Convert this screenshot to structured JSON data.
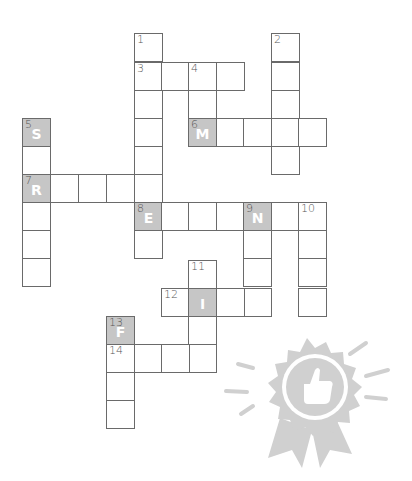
{
  "puzzle": {
    "cell_size": 28,
    "cells": [
      {
        "x": 134,
        "y": 33,
        "num": "1"
      },
      {
        "x": 134,
        "y": 62,
        "num": "3"
      },
      {
        "x": 161,
        "y": 62
      },
      {
        "x": 188,
        "y": 62,
        "num": "4"
      },
      {
        "x": 216,
        "y": 62
      },
      {
        "x": 134,
        "y": 90
      },
      {
        "x": 188,
        "y": 90
      },
      {
        "x": 134,
        "y": 118
      },
      {
        "x": 134,
        "y": 146
      },
      {
        "x": 134,
        "y": 174
      },
      {
        "x": 134,
        "y": 202,
        "num": "8",
        "letter": "E",
        "given": true
      },
      {
        "x": 134,
        "y": 230
      },
      {
        "x": 271,
        "y": 33,
        "num": "2"
      },
      {
        "x": 271,
        "y": 62
      },
      {
        "x": 271,
        "y": 90
      },
      {
        "x": 271,
        "y": 118
      },
      {
        "x": 271,
        "y": 146
      },
      {
        "x": 188,
        "y": 118,
        "num": "6",
        "letter": "M",
        "given": true
      },
      {
        "x": 216,
        "y": 118
      },
      {
        "x": 243,
        "y": 118
      },
      {
        "x": 298,
        "y": 118
      },
      {
        "x": 22,
        "y": 118,
        "num": "5",
        "letter": "S",
        "given": true
      },
      {
        "x": 22,
        "y": 146
      },
      {
        "x": 22,
        "y": 174,
        "num": "7",
        "letter": "R",
        "given": true
      },
      {
        "x": 22,
        "y": 202
      },
      {
        "x": 22,
        "y": 230
      },
      {
        "x": 22,
        "y": 258
      },
      {
        "x": 50,
        "y": 174
      },
      {
        "x": 78,
        "y": 174
      },
      {
        "x": 106,
        "y": 174
      },
      {
        "x": 161,
        "y": 202
      },
      {
        "x": 188,
        "y": 202
      },
      {
        "x": 216,
        "y": 202
      },
      {
        "x": 243,
        "y": 202,
        "num": "9",
        "letter": "N",
        "given": true
      },
      {
        "x": 271,
        "y": 202
      },
      {
        "x": 298,
        "y": 202,
        "num": "10"
      },
      {
        "x": 243,
        "y": 230
      },
      {
        "x": 243,
        "y": 258
      },
      {
        "x": 243,
        "y": 288
      },
      {
        "x": 298,
        "y": 230
      },
      {
        "x": 298,
        "y": 258
      },
      {
        "x": 298,
        "y": 288
      },
      {
        "x": 188,
        "y": 260,
        "num": "11"
      },
      {
        "x": 161,
        "y": 288,
        "num": "12"
      },
      {
        "x": 188,
        "y": 288,
        "letter": "I",
        "given": true
      },
      {
        "x": 216,
        "y": 288
      },
      {
        "x": 188,
        "y": 316
      },
      {
        "x": 188,
        "y": 344
      },
      {
        "x": 106,
        "y": 316,
        "num": "13",
        "letter": "F",
        "given": true
      },
      {
        "x": 106,
        "y": 344,
        "num": "14"
      },
      {
        "x": 134,
        "y": 344
      },
      {
        "x": 161,
        "y": 344
      },
      {
        "x": 106,
        "y": 372
      },
      {
        "x": 106,
        "y": 400
      }
    ]
  },
  "badge": {
    "icon": "thumbs-up-award-ribbon-icon",
    "color": "#cfcfcf"
  },
  "colors": {
    "given_cell": "#c6c6c6",
    "border": "#6a6a6a"
  }
}
